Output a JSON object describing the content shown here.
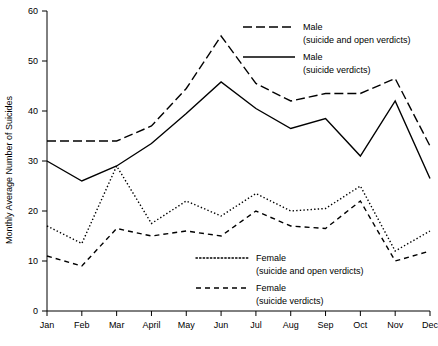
{
  "chart_data": {
    "type": "line",
    "title": "",
    "xlabel": "",
    "ylabel": "Monthly Average Number of Suicides",
    "categories": [
      "Jan",
      "Feb",
      "Mar",
      "April",
      "May",
      "Jun",
      "Jul",
      "Aug",
      "Sep",
      "Oct",
      "Nov",
      "Dec"
    ],
    "ylim": [
      0,
      60
    ],
    "yticks": [
      0,
      10,
      20,
      30,
      40,
      50,
      60
    ],
    "ytick_labels": [
      "0",
      "10",
      "20",
      "30",
      "40",
      "50",
      "60"
    ],
    "grid": false,
    "legend_position": "inside",
    "series": [
      {
        "name": "Male (suicide and open verdicts)",
        "label_line1": "Male",
        "label_line2": "(suicide and open verdicts)",
        "style": "long-dash",
        "values": [
          34,
          34,
          34,
          37,
          44.5,
          55,
          45.5,
          42,
          43.5,
          43.5,
          46.5,
          33
        ]
      },
      {
        "name": "Male (suicide verdicts)",
        "label_line1": "Male",
        "label_line2": "(suicide verdicts)",
        "style": "solid",
        "values": [
          30,
          26,
          29,
          33.5,
          39.5,
          45.8,
          40.5,
          36.5,
          38.5,
          31,
          42,
          26.5
        ]
      },
      {
        "name": "Female (suicide and open verdicts)",
        "label_line1": "Female",
        "label_line2": "(suicide and open verdicts)",
        "style": "dotted",
        "values": [
          17,
          13.5,
          29,
          17.5,
          22,
          19,
          23.5,
          20,
          20.5,
          25,
          12,
          16
        ]
      },
      {
        "name": "Female (suicide verdicts)",
        "label_line1": "Female",
        "label_line2": "(suicide verdicts)",
        "style": "short-dash",
        "values": [
          11,
          9,
          16.5,
          15,
          16,
          15,
          20,
          17,
          16.5,
          22,
          10,
          12
        ]
      }
    ]
  },
  "legend": {
    "entries": [
      {
        "line1": "Male",
        "line2": "(suicide and open verdicts)"
      },
      {
        "line1": "Male",
        "line2": "(suicide verdicts)"
      },
      {
        "line1": "Female",
        "line2": "(suicide and open verdicts)"
      },
      {
        "line1": "Female",
        "line2": "(suicide verdicts)"
      }
    ]
  }
}
